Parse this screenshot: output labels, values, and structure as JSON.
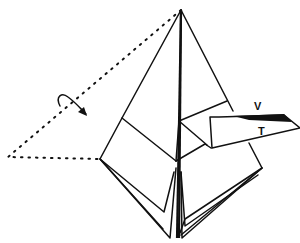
{
  "diagram": {
    "type": "origami-folding-step",
    "labels": {
      "v": "V",
      "t": "T"
    },
    "colors": {
      "ink": "#111111",
      "background": "#ffffff"
    },
    "symbols": [
      "curved-arrow-fold-behind",
      "dotted-line-turn-over-outline",
      "valley-fold-flap"
    ]
  }
}
